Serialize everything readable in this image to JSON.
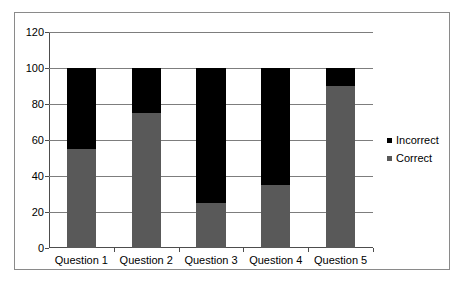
{
  "chart_data": {
    "type": "bar",
    "subtype": "stacked-bar",
    "title": "",
    "subtitle": "",
    "xlabel": "",
    "ylabel": "",
    "categories": [
      "Question 1",
      "Question 2",
      "Question 3",
      "Question 4",
      "Question 5"
    ],
    "series": [
      {
        "name": "Correct",
        "values": [
          55,
          75,
          25,
          35,
          90
        ],
        "color": "#595959"
      },
      {
        "name": "Incorrect",
        "values": [
          45,
          25,
          75,
          65,
          10
        ],
        "color": "#000000"
      }
    ],
    "stack_order": [
      "Correct",
      "Incorrect"
    ],
    "ylim": [
      0,
      120
    ],
    "ytick_step": 20,
    "yticks": [
      0,
      20,
      40,
      60,
      80,
      100,
      120
    ],
    "ytick_labels": [
      "0",
      "20",
      "40",
      "60",
      "80",
      "100",
      "120"
    ],
    "grid": {
      "horizontal": true,
      "vertical": false
    },
    "legend": {
      "position": "right",
      "entries": [
        "Incorrect",
        "Correct"
      ]
    },
    "plot_background": "#FFFFFF",
    "border_color": "#8A8A8A",
    "gridline_color": "#7D7D7D",
    "axis_color": "#4D4D4D"
  }
}
